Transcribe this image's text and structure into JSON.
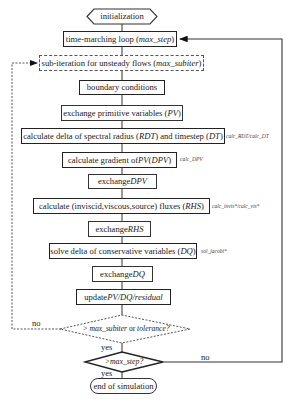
{
  "flowchart": {
    "start": {
      "label": "initialization"
    },
    "time_loop": {
      "prefix": "time-marching loop (",
      "var": "max_step",
      "suffix": ")"
    },
    "sub_iter": {
      "prefix": "sub-iteration for unsteady flows (",
      "var": "max_subiter",
      "suffix": ")"
    },
    "boundary": {
      "label": "boundary conditions"
    },
    "exchange_pv": {
      "prefix": "exchange primitive variables (",
      "var": "PV",
      "suffix": ")"
    },
    "calc_rdt": {
      "t1": "calculate delta of spectral radius (",
      "v1": "RDT",
      "t2": ") and timestep (",
      "v2": "DT",
      "t3": ")",
      "routine": "calc_RDT/calc_DT"
    },
    "calc_dpv": {
      "t1": "calculate gradient of ",
      "v1": "PV",
      "t2": " (",
      "v2": "DPV",
      "t3": ")",
      "routine": "calc_DPV"
    },
    "exchange_dpv": {
      "prefix": "exchange ",
      "var": "DPV"
    },
    "calc_rhs": {
      "prefix": "calculate (inviscid,viscous,source) fluxes (",
      "var": "RHS",
      "suffix": ")",
      "routine": "calc_invis*/calc_vis*"
    },
    "exchange_rhs": {
      "prefix": "exchange ",
      "var": "RHS"
    },
    "solve_dq": {
      "prefix": "solve delta of conservative variables (",
      "var": "DQ",
      "suffix": ")",
      "routine": "sol_jacobi*"
    },
    "exchange_dq": {
      "prefix": "exchange ",
      "var": "DQ"
    },
    "update": {
      "prefix": "update ",
      "var": "PV/DQ/residual"
    },
    "decision_subiter": {
      "t1": "> max_subiter",
      "t2": " or ",
      "t3": " tolerance?",
      "no": "no",
      "yes": "yes"
    },
    "decision_step": {
      "label": ">max_step?",
      "no": "no",
      "yes": "yes"
    },
    "end": {
      "label": "end of simulation"
    }
  }
}
